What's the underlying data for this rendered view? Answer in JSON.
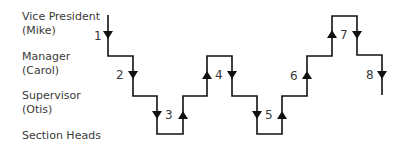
{
  "levels": [
    {
      "title": "Vice President",
      "name": "(Mike)"
    },
    {
      "title": "Manager",
      "name": "(Carol)"
    },
    {
      "title": "Supervisor",
      "name": "(Otis)"
    },
    {
      "title": "Section Heads"
    }
  ],
  "steps": [
    {
      "label": "1",
      "direction": "down"
    },
    {
      "label": "2",
      "direction": "down"
    },
    {
      "label": "3",
      "direction": "down-up"
    },
    {
      "label": "4",
      "direction": "up-down"
    },
    {
      "label": "5",
      "direction": "down-up"
    },
    {
      "label": "6",
      "direction": "up"
    },
    {
      "label": "7",
      "direction": "up-down"
    },
    {
      "label": "8",
      "direction": "down"
    }
  ],
  "colors": {
    "line": "#111111",
    "text": "#3a3a3a"
  }
}
